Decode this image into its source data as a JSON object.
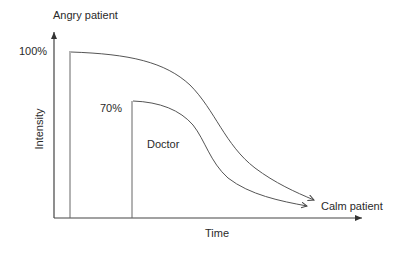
{
  "diagram": {
    "type": "line-diagram",
    "title": "",
    "y_axis": {
      "label": "Intensity",
      "top_label": "Angry patient"
    },
    "x_axis": {
      "label": "Time",
      "end_label": "Calm patient"
    },
    "series": [
      {
        "name": "patient",
        "start_label": "100%",
        "start_value": 100
      },
      {
        "name": "doctor",
        "start_label": "70%",
        "start_value": 70,
        "curve_label": "Doctor"
      }
    ],
    "colors": {
      "line": "#555555",
      "axis": "#333333",
      "background": "#ffffff"
    }
  }
}
